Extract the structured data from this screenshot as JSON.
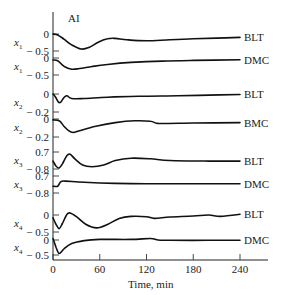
{
  "chart_data": {
    "type": "line",
    "title": "AI",
    "xlabel": "Time, min",
    "xlim": [
      0,
      240
    ],
    "xticks": [
      0,
      60,
      120,
      180,
      240
    ],
    "grid": false,
    "panels": [
      {
        "ylabel": "x1",
        "series": "BLT",
        "ticks": [
          {
            "label": "0",
            "value": 0
          },
          {
            "label": "− 0.5",
            "value": -0.5
          }
        ],
        "points": [
          [
            0,
            0
          ],
          [
            6,
            -0.03
          ],
          [
            14,
            -0.15
          ],
          [
            24,
            -0.32
          ],
          [
            36,
            -0.44
          ],
          [
            46,
            -0.4
          ],
          [
            58,
            -0.24
          ],
          [
            70,
            -0.14
          ],
          [
            80,
            -0.13
          ],
          [
            95,
            -0.17
          ],
          [
            120,
            -0.2
          ],
          [
            150,
            -0.17
          ],
          [
            180,
            -0.14
          ],
          [
            210,
            -0.12
          ],
          [
            240,
            -0.1
          ]
        ]
      },
      {
        "ylabel": "x1",
        "series": "DMC",
        "ticks": [
          {
            "label": "0",
            "value": 0
          },
          {
            "label": "− 0.5",
            "value": -0.5
          }
        ],
        "points": [
          [
            0,
            -0.06
          ],
          [
            6,
            -0.08
          ],
          [
            14,
            -0.24
          ],
          [
            24,
            -0.33
          ],
          [
            34,
            -0.31
          ],
          [
            50,
            -0.25
          ],
          [
            70,
            -0.19
          ],
          [
            100,
            -0.13
          ],
          [
            140,
            -0.09
          ],
          [
            180,
            -0.07
          ],
          [
            240,
            -0.05
          ]
        ]
      },
      {
        "ylabel": "x2",
        "series": "BLT",
        "ticks": [
          {
            "label": "0",
            "value": 0
          },
          {
            "label": "− 0.2",
            "value": -0.2
          }
        ],
        "points": [
          [
            0,
            0
          ],
          [
            3,
            -0.03
          ],
          [
            7,
            -0.09
          ],
          [
            10,
            -0.09
          ],
          [
            14,
            -0.04
          ],
          [
            18,
            -0.02
          ],
          [
            24,
            -0.05
          ],
          [
            40,
            -0.05
          ],
          [
            70,
            -0.035
          ],
          [
            110,
            -0.025
          ],
          [
            160,
            -0.02
          ],
          [
            200,
            -0.012
          ],
          [
            240,
            -0.005
          ]
        ]
      },
      {
        "ylabel": "x2",
        "series": "BMC",
        "ticks": [
          {
            "label": "0",
            "value": 0
          },
          {
            "label": "− 0.2",
            "value": -0.2
          }
        ],
        "points": [
          [
            0,
            -0.01
          ],
          [
            8,
            -0.02
          ],
          [
            14,
            -0.08
          ],
          [
            20,
            -0.13
          ],
          [
            26,
            -0.15
          ],
          [
            34,
            -0.13
          ],
          [
            55,
            -0.08
          ],
          [
            80,
            -0.04
          ],
          [
            105,
            -0.02
          ],
          [
            125,
            -0.025
          ],
          [
            132,
            -0.045
          ],
          [
            140,
            -0.05
          ],
          [
            180,
            -0.045
          ],
          [
            240,
            -0.04
          ]
        ]
      },
      {
        "ylabel": "x3",
        "series": "BLT",
        "ticks": [
          {
            "label": "0.7",
            "value": 0.7
          },
          {
            "label": "− 0.8",
            "value": -0.8
          }
        ],
        "points": [
          [
            0,
            -0.1
          ],
          [
            4,
            -0.55
          ],
          [
            8,
            -0.7
          ],
          [
            12,
            -0.35
          ],
          [
            18,
            0.4
          ],
          [
            22,
            0.5
          ],
          [
            28,
            0.1
          ],
          [
            38,
            -0.45
          ],
          [
            50,
            -0.6
          ],
          [
            65,
            -0.45
          ],
          [
            80,
            -0.05
          ],
          [
            100,
            0.15
          ],
          [
            125,
            0.1
          ],
          [
            150,
            -0.05
          ],
          [
            200,
            -0.1
          ],
          [
            240,
            -0.1
          ]
        ]
      },
      {
        "ylabel": "x3",
        "series": "DMC",
        "ticks": [
          {
            "label": "0.7",
            "value": 0.7
          },
          {
            "label": "− 0.8",
            "value": -0.8
          }
        ],
        "points": [
          [
            0,
            -0.2
          ],
          [
            6,
            -0.2
          ],
          [
            10,
            0.2
          ],
          [
            16,
            0.25
          ],
          [
            40,
            0.15
          ],
          [
            80,
            0.05
          ],
          [
            120,
            0.02
          ],
          [
            180,
            0.02
          ],
          [
            240,
            0.02
          ]
        ]
      },
      {
        "ylabel": "x4",
        "series": "BLT",
        "ticks": [
          {
            "label": "0",
            "value": 0
          },
          {
            "label": "− 0.5",
            "value": -0.5
          }
        ],
        "points": [
          [
            0,
            -0.08
          ],
          [
            4,
            -0.28
          ],
          [
            8,
            -0.4
          ],
          [
            12,
            -0.25
          ],
          [
            18,
            0.02
          ],
          [
            22,
            0.06
          ],
          [
            30,
            -0.05
          ],
          [
            42,
            -0.27
          ],
          [
            56,
            -0.38
          ],
          [
            70,
            -0.28
          ],
          [
            85,
            -0.1
          ],
          [
            100,
            -0.04
          ],
          [
            120,
            -0.05
          ],
          [
            130,
            -0.1
          ],
          [
            150,
            -0.06
          ],
          [
            180,
            -0.03
          ],
          [
            200,
            0.0
          ],
          [
            215,
            -0.04
          ],
          [
            240,
            0.02
          ]
        ]
      },
      {
        "ylabel": "x4",
        "series": "DMC",
        "ticks": [
          {
            "label": "0",
            "value": 0
          },
          {
            "label": "− 0.5",
            "value": -0.5
          }
        ],
        "points": [
          [
            0,
            0.05
          ],
          [
            4,
            -0.25
          ],
          [
            8,
            -0.45
          ],
          [
            14,
            -0.3
          ],
          [
            24,
            -0.12
          ],
          [
            40,
            -0.02
          ],
          [
            60,
            0.02
          ],
          [
            100,
            0.02
          ],
          [
            125,
            0.05
          ],
          [
            135,
            0.0
          ],
          [
            150,
            -0.01
          ],
          [
            200,
            -0.01
          ],
          [
            240,
            -0.01
          ]
        ]
      }
    ]
  },
  "layout": {
    "x0": 53,
    "x1": 240,
    "axis_bottom": 260,
    "panel_ticks_px": [
      [
        34,
        51
      ],
      [
        58,
        75
      ],
      [
        94,
        112
      ],
      [
        119,
        137
      ],
      [
        152,
        169
      ],
      [
        176,
        193
      ],
      [
        215,
        232
      ],
      [
        240,
        255
      ]
    ]
  }
}
